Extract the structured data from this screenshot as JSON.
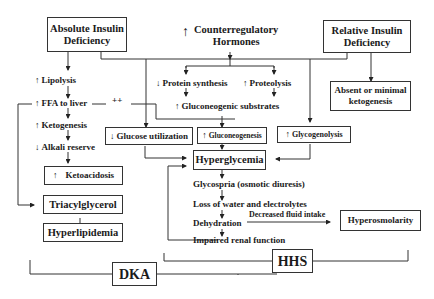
{
  "diagram": {
    "nodes": {
      "absolute_insulin": "Absolute Insulin Deficiency",
      "absolute_insulin_l1": "Absolute Insulin",
      "absolute_insulin_l2": "Deficiency",
      "counterreg_l1": "Counterregulatory",
      "counterreg_l2": "Hormones",
      "counterreg_prefix": "↑",
      "relative_insulin_l1": "Relative Insulin",
      "relative_insulin_l2": "Deficiency",
      "lipolysis": "Lipolysis",
      "lipolysis_prefix": "↑",
      "protein_synthesis": "Protein synthesis",
      "protein_synthesis_prefix": "↓",
      "proteolysis": "Proteolysis",
      "proteolysis_prefix": "↑",
      "absent_ketogenesis_l1": "Absent or minimal",
      "absent_ketogenesis_l2": "ketogenesis",
      "ffa_to_liver": "FFA to liver",
      "ffa_prefix": "↑",
      "plusplus": "++",
      "gluconeogenic_substrates": "Gluconeogenic substrates",
      "gluconeogenic_prefix": "↑",
      "ketogenesis": "Ketogenesis",
      "ketogenesis_prefix": "↑",
      "glucose_utilization": "Glucose utilization",
      "glucose_utilization_prefix": "↓",
      "gluconeogenesis": "Gluconeogenesis",
      "gluconeogenesis_prefix": "↑",
      "glycogenolysis": "Glycogenolysis",
      "glycogenolysis_prefix": "↑",
      "alkali_reserve": "Alkali reserve",
      "alkali_prefix": "↓",
      "hyperglycemia": "Hyperglycemia",
      "ketoacidosis": "Ketoacidosis",
      "ketoacidosis_prefix": "↑",
      "glycosuria": "Glycospria (osmotic diuresis)",
      "triacylglycerol": "Triacylglycerol",
      "loss_water": "Loss of water and electrolytes",
      "dehydration": "Dehydration",
      "decreased_fluid": "Decreased fluid intake",
      "hyperosmolarity": "Hyperosmolarity",
      "hyperlipidemia": "Hyperlipidemia",
      "impaired_renal": "Impaired renal function",
      "dka": "DKA",
      "hhs": "HHS"
    }
  }
}
